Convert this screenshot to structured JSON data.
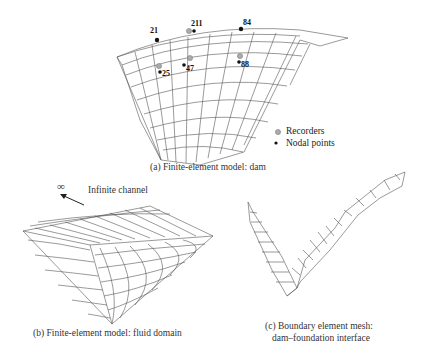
{
  "panel_a": {
    "caption": "(a) Finite-element model: dam",
    "node_labels": [
      "21",
      "211",
      "84",
      "25",
      "47",
      "88"
    ],
    "legend": {
      "recorders": "Recorders",
      "nodal_points": "Nodal points"
    }
  },
  "panel_b": {
    "caption": "(b) Finite-element model: fluid domain",
    "infinity_symbol": "∞",
    "channel_label": "Infinite channel"
  },
  "panel_c": {
    "caption_line1": "(c) Boundary element mesh:",
    "caption_line2": "dam–foundation interface"
  }
}
